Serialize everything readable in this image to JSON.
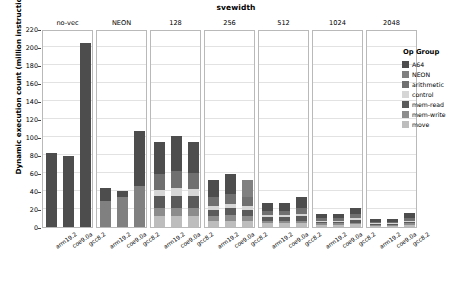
{
  "chart_data": {
    "type": "bar",
    "subtype": "stacked-bar-faceted",
    "title": "svewidth",
    "xlabel": "",
    "ylabel": "Dynamic execution count (million instructions)",
    "ylim": [
      0,
      220
    ],
    "yticks": [
      0,
      20,
      40,
      60,
      80,
      100,
      120,
      140,
      160,
      180,
      200,
      220
    ],
    "ytick_labels": [
      "0",
      "20",
      "40",
      "60",
      "80",
      "100",
      "120",
      "140",
      "160",
      "180",
      "200",
      "220"
    ],
    "grid": true,
    "legend_position": "right",
    "legend_title": "Op Group",
    "facet_label": "svewidth",
    "facets": [
      "no-vec",
      "NEON",
      "128",
      "256",
      "512",
      "1024",
      "2048"
    ],
    "categories": [
      "arm19.2",
      "coe9.0a",
      "gcc8.2"
    ],
    "series": [
      {
        "name": "A64",
        "color": "#4d4d4d"
      },
      {
        "name": "NEON",
        "color": "#808080"
      },
      {
        "name": "arithmetic",
        "color": "#707070"
      },
      {
        "name": "control",
        "color": "#d6d6d6"
      },
      {
        "name": "mem-read",
        "color": "#5a5a5a"
      },
      {
        "name": "mem-write",
        "color": "#8c8c8c"
      },
      {
        "name": "move",
        "color": "#bdbdbd"
      }
    ],
    "panels": [
      {
        "facet": "no-vec",
        "bars": [
          {
            "category": "arm19.2",
            "total": 82,
            "segments": [
              {
                "series": "move",
                "value": 0
              },
              {
                "series": "mem-write",
                "value": 0
              },
              {
                "series": "mem-read",
                "value": 0
              },
              {
                "series": "control",
                "value": 0
              },
              {
                "series": "arithmetic",
                "value": 0
              },
              {
                "series": "NEON",
                "value": 0
              },
              {
                "series": "A64",
                "value": 82
              }
            ]
          },
          {
            "category": "coe9.0a",
            "total": 79,
            "segments": [
              {
                "series": "move",
                "value": 0
              },
              {
                "series": "mem-write",
                "value": 0
              },
              {
                "series": "mem-read",
                "value": 0
              },
              {
                "series": "control",
                "value": 0
              },
              {
                "series": "arithmetic",
                "value": 0
              },
              {
                "series": "NEON",
                "value": 0
              },
              {
                "series": "A64",
                "value": 79
              }
            ]
          },
          {
            "category": "gcc8.2",
            "total": 204,
            "segments": [
              {
                "series": "move",
                "value": 0
              },
              {
                "series": "mem-write",
                "value": 0
              },
              {
                "series": "mem-read",
                "value": 0
              },
              {
                "series": "control",
                "value": 0
              },
              {
                "series": "arithmetic",
                "value": 0
              },
              {
                "series": "NEON",
                "value": 0
              },
              {
                "series": "A64",
                "value": 204
              }
            ]
          }
        ]
      },
      {
        "facet": "NEON",
        "bars": [
          {
            "category": "arm19.2",
            "total": 43,
            "segments": [
              {
                "series": "move",
                "value": 0
              },
              {
                "series": "mem-write",
                "value": 0
              },
              {
                "series": "mem-read",
                "value": 0
              },
              {
                "series": "control",
                "value": 0
              },
              {
                "series": "arithmetic",
                "value": 0
              },
              {
                "series": "NEON",
                "value": 29
              },
              {
                "series": "A64",
                "value": 14
              }
            ]
          },
          {
            "category": "coe9.0a",
            "total": 40,
            "segments": [
              {
                "series": "move",
                "value": 0
              },
              {
                "series": "mem-write",
                "value": 0
              },
              {
                "series": "mem-read",
                "value": 0
              },
              {
                "series": "control",
                "value": 0
              },
              {
                "series": "arithmetic",
                "value": 0
              },
              {
                "series": "NEON",
                "value": 33
              },
              {
                "series": "A64",
                "value": 7
              }
            ]
          },
          {
            "category": "gcc8.2",
            "total": 107,
            "segments": [
              {
                "series": "move",
                "value": 0
              },
              {
                "series": "mem-write",
                "value": 0
              },
              {
                "series": "mem-read",
                "value": 0
              },
              {
                "series": "control",
                "value": 0
              },
              {
                "series": "arithmetic",
                "value": 0
              },
              {
                "series": "NEON",
                "value": 46
              },
              {
                "series": "A64",
                "value": 61
              }
            ]
          }
        ]
      },
      {
        "facet": "128",
        "bars": [
          {
            "category": "arm19.2",
            "total": 95,
            "segments": [
              {
                "series": "move",
                "value": 12
              },
              {
                "series": "mem-write",
                "value": 9
              },
              {
                "series": "mem-read",
                "value": 13
              },
              {
                "series": "control",
                "value": 7
              },
              {
                "series": "arithmetic",
                "value": 18
              },
              {
                "series": "NEON",
                "value": 0
              },
              {
                "series": "A64",
                "value": 36
              }
            ]
          },
          {
            "category": "coe9.0a",
            "total": 101,
            "segments": [
              {
                "series": "move",
                "value": 12
              },
              {
                "series": "mem-write",
                "value": 9
              },
              {
                "series": "mem-read",
                "value": 14
              },
              {
                "series": "control",
                "value": 8
              },
              {
                "series": "arithmetic",
                "value": 19
              },
              {
                "series": "NEON",
                "value": 0
              },
              {
                "series": "A64",
                "value": 39
              }
            ]
          },
          {
            "category": "gcc8.2",
            "total": 95,
            "segments": [
              {
                "series": "move",
                "value": 12
              },
              {
                "series": "mem-write",
                "value": 9
              },
              {
                "series": "mem-read",
                "value": 13
              },
              {
                "series": "control",
                "value": 8
              },
              {
                "series": "arithmetic",
                "value": 18
              },
              {
                "series": "NEON",
                "value": 0
              },
              {
                "series": "A64",
                "value": 35
              }
            ]
          }
        ]
      },
      {
        "facet": "256",
        "bars": [
          {
            "category": "arm19.2",
            "total": 52,
            "segments": [
              {
                "series": "move",
                "value": 7
              },
              {
                "series": "mem-write",
                "value": 5
              },
              {
                "series": "mem-read",
                "value": 7
              },
              {
                "series": "control",
                "value": 4
              },
              {
                "series": "arithmetic",
                "value": 10
              },
              {
                "series": "NEON",
                "value": 0
              },
              {
                "series": "A64",
                "value": 19
              }
            ]
          },
          {
            "category": "coe9.0a",
            "total": 59,
            "segments": [
              {
                "series": "move",
                "value": 7
              },
              {
                "series": "mem-write",
                "value": 6
              },
              {
                "series": "mem-read",
                "value": 8
              },
              {
                "series": "control",
                "value": 5
              },
              {
                "series": "arithmetic",
                "value": 11
              },
              {
                "series": "NEON",
                "value": 0
              },
              {
                "series": "A64",
                "value": 22
              }
            ]
          },
          {
            "category": "gcc8.2",
            "total": 52,
            "segments": [
              {
                "series": "move",
                "value": 7
              },
              {
                "series": "mem-write",
                "value": 5
              },
              {
                "series": "mem-read",
                "value": 7
              },
              {
                "series": "control",
                "value": 4
              },
              {
                "series": "arithmetic",
                "value": 10
              },
              {
                "series": "NEON",
                "value": 19
              }
            ]
          }
        ]
      },
      {
        "facet": "512",
        "bars": [
          {
            "category": "arm19.2",
            "total": 27,
            "segments": [
              {
                "series": "move",
                "value": 4
              },
              {
                "series": "mem-write",
                "value": 3
              },
              {
                "series": "mem-read",
                "value": 4
              },
              {
                "series": "control",
                "value": 2
              },
              {
                "series": "arithmetic",
                "value": 5
              },
              {
                "series": "NEON",
                "value": 0
              },
              {
                "series": "A64",
                "value": 9
              }
            ]
          },
          {
            "category": "coe9.0a",
            "total": 27,
            "segments": [
              {
                "series": "move",
                "value": 4
              },
              {
                "series": "mem-write",
                "value": 3
              },
              {
                "series": "mem-read",
                "value": 4
              },
              {
                "series": "control",
                "value": 2
              },
              {
                "series": "arithmetic",
                "value": 5
              },
              {
                "series": "NEON",
                "value": 0
              },
              {
                "series": "A64",
                "value": 9
              }
            ]
          },
          {
            "category": "gcc8.2",
            "total": 33,
            "segments": [
              {
                "series": "move",
                "value": 4
              },
              {
                "series": "mem-write",
                "value": 3
              },
              {
                "series": "mem-read",
                "value": 5
              },
              {
                "series": "control",
                "value": 3
              },
              {
                "series": "arithmetic",
                "value": 6
              },
              {
                "series": "NEON",
                "value": 0
              },
              {
                "series": "A64",
                "value": 12
              }
            ]
          }
        ]
      },
      {
        "facet": "1024",
        "bars": [
          {
            "category": "arm19.2",
            "total": 15,
            "segments": [
              {
                "series": "move",
                "value": 2
              },
              {
                "series": "mem-write",
                "value": 2
              },
              {
                "series": "mem-read",
                "value": 2
              },
              {
                "series": "control",
                "value": 1
              },
              {
                "series": "arithmetic",
                "value": 3
              },
              {
                "series": "NEON",
                "value": 0
              },
              {
                "series": "A64",
                "value": 5
              }
            ]
          },
          {
            "category": "coe9.0a",
            "total": 15,
            "segments": [
              {
                "series": "move",
                "value": 2
              },
              {
                "series": "mem-write",
                "value": 2
              },
              {
                "series": "mem-read",
                "value": 2
              },
              {
                "series": "control",
                "value": 1
              },
              {
                "series": "arithmetic",
                "value": 3
              },
              {
                "series": "NEON",
                "value": 0
              },
              {
                "series": "A64",
                "value": 5
              }
            ]
          },
          {
            "category": "gcc8.2",
            "total": 21,
            "segments": [
              {
                "series": "move",
                "value": 3
              },
              {
                "series": "mem-write",
                "value": 2
              },
              {
                "series": "mem-read",
                "value": 3
              },
              {
                "series": "control",
                "value": 2
              },
              {
                "series": "arithmetic",
                "value": 4
              },
              {
                "series": "NEON",
                "value": 0
              },
              {
                "series": "A64",
                "value": 7
              }
            ]
          }
        ]
      },
      {
        "facet": "2048",
        "bars": [
          {
            "category": "arm19.2",
            "total": 9,
            "segments": [
              {
                "series": "move",
                "value": 1
              },
              {
                "series": "mem-write",
                "value": 1
              },
              {
                "series": "mem-read",
                "value": 1
              },
              {
                "series": "control",
                "value": 1
              },
              {
                "series": "arithmetic",
                "value": 2
              },
              {
                "series": "NEON",
                "value": 0
              },
              {
                "series": "A64",
                "value": 3
              }
            ]
          },
          {
            "category": "coe9.0a",
            "total": 9,
            "segments": [
              {
                "series": "move",
                "value": 1
              },
              {
                "series": "mem-write",
                "value": 1
              },
              {
                "series": "mem-read",
                "value": 1
              },
              {
                "series": "control",
                "value": 1
              },
              {
                "series": "arithmetic",
                "value": 2
              },
              {
                "series": "NEON",
                "value": 0
              },
              {
                "series": "A64",
                "value": 3
              }
            ]
          },
          {
            "category": "gcc8.2",
            "total": 16,
            "segments": [
              {
                "series": "move",
                "value": 2
              },
              {
                "series": "mem-write",
                "value": 2
              },
              {
                "series": "mem-read",
                "value": 2
              },
              {
                "series": "control",
                "value": 1
              },
              {
                "series": "arithmetic",
                "value": 3
              },
              {
                "series": "NEON",
                "value": 0
              },
              {
                "series": "A64",
                "value": 6
              }
            ]
          }
        ]
      }
    ]
  }
}
